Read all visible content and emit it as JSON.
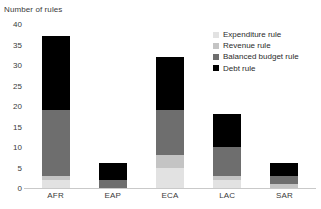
{
  "chart_data": {
    "type": "bar",
    "subtype": "stacked-bar",
    "title": "",
    "ylabel": "Number of rules",
    "xlabel": "",
    "ylim": [
      0,
      40
    ],
    "yticks": [
      0,
      5,
      10,
      15,
      20,
      25,
      30,
      35,
      40
    ],
    "ytick_labels": [
      "0",
      "5",
      "10",
      "15",
      "20",
      "25",
      "30",
      "35",
      "40"
    ],
    "grid": false,
    "legend_position": "upper right",
    "categories": [
      "AFR",
      "EAP",
      "ECA",
      "LAC",
      "SAR"
    ],
    "series": [
      {
        "name": "Expenditure rule",
        "color": "#e2e2e2",
        "values": [
          2,
          0,
          5,
          2,
          0
        ]
      },
      {
        "name": "Revenue rule",
        "color": "#c4c4c4",
        "values": [
          1,
          0,
          3,
          1,
          1
        ]
      },
      {
        "name": "Balanced budget rule",
        "color": "#6e6e6e",
        "values": [
          16,
          2,
          11,
          7,
          2
        ]
      },
      {
        "name": "Debt rule",
        "color": "#000000",
        "values": [
          18,
          4,
          13,
          8,
          3
        ]
      }
    ],
    "totals": [
      37,
      6,
      32,
      18,
      6
    ]
  },
  "legend": {
    "items": [
      {
        "label": "Expenditure rule"
      },
      {
        "label": "Revenue rule"
      },
      {
        "label": "Balanced budget rule"
      },
      {
        "label": "Debt rule"
      }
    ]
  },
  "axis": {
    "y_title": "Number of rules"
  }
}
